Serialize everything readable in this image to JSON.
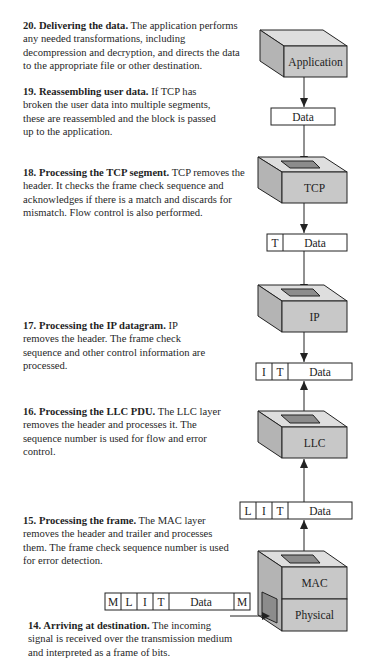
{
  "steps": [
    {
      "num": "20.",
      "title": "Delivering the data.",
      "text": " The application performs any needed transformations, including decompression and decryption, and directs the data to the appropriate file or other destination."
    },
    {
      "num": "19.",
      "title": "Reassembling user data.",
      "text": " If TCP has broken the user data into multiple segments, these are reassembled and the block is passed up to the application."
    },
    {
      "num": "18.",
      "title": "Processing the TCP segment.",
      "text": " TCP removes the header. It checks the frame check sequence and acknowledges if there is a match and discards for mismatch. Flow control is also performed."
    },
    {
      "num": "17.",
      "title": "Processing the IP datagram.",
      "text": " IP removes the header. The frame check sequence and other control information are processed."
    },
    {
      "num": "16.",
      "title": "Processing the LLC PDU.",
      "text": " The LLC layer removes the header and processes it. The sequence number is used for flow and error control."
    },
    {
      "num": "15.",
      "title": "Processing the frame.",
      "text": " The MAC layer removes the header and trailer and processes them. The frame check sequence number is used for error detection."
    },
    {
      "num": "14.",
      "title": "Arriving at destination.",
      "text": " The incoming signal is received over the transmission medium and interpreted as a frame of bits."
    }
  ],
  "layers": {
    "application": "Application",
    "tcp": "TCP",
    "ip": "IP",
    "llc": "LLC",
    "mac": "MAC",
    "physical": "Physical"
  },
  "pdus": {
    "data": [
      "Data"
    ],
    "tcp_segment": [
      "T",
      "Data"
    ],
    "ip_datagram": [
      "I",
      "T",
      "Data"
    ],
    "llc_pdu": [
      "L",
      "I",
      "T",
      "Data"
    ],
    "mac_frame": [
      "M",
      "L",
      "I",
      "T",
      "Data",
      "M"
    ]
  },
  "colors": {
    "box_front": "#c8c8c8",
    "box_top": "#dedede",
    "box_side": "#b4b4b4",
    "hole": "#8c8c8c",
    "line": "#222222"
  }
}
